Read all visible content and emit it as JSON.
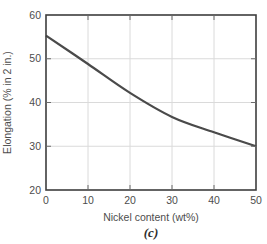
{
  "figure": {
    "caption": "(c)"
  },
  "chart_data": {
    "type": "line",
    "title": "",
    "xlabel": "Nickel content (wt%)",
    "ylabel": "Elongation (% in 2 in.)",
    "xlim": [
      0,
      50
    ],
    "ylim": [
      20,
      60
    ],
    "xticks": [
      0,
      10,
      20,
      30,
      40,
      50
    ],
    "yticks": [
      20,
      30,
      40,
      50,
      60
    ],
    "grid": true,
    "legend": "none",
    "series": [
      {
        "name": "elongation-vs-nickel-content",
        "x": [
          0,
          10,
          20,
          30,
          40,
          50
        ],
        "y": [
          55.3,
          48.8,
          42.2,
          36.7,
          33.2,
          30.0
        ]
      }
    ],
    "colors": {
      "curve": "#4a4a4a",
      "frame": "#3e3e3e",
      "grid": "#dadada",
      "tick": "#6b6b6b",
      "text": "#4d4d4d",
      "background": "#ffffff"
    }
  }
}
